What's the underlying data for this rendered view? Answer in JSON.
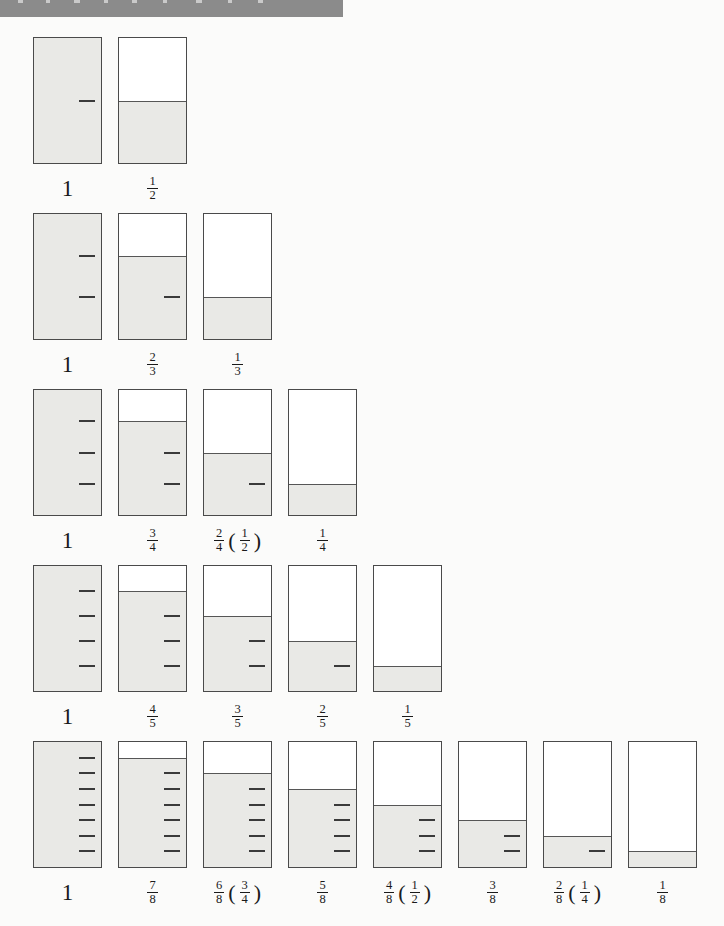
{
  "colors": {
    "title_bar": "#8b8b8b",
    "glass_fill": "#e9e9e6",
    "glass_border": "#4a4a4a",
    "fill_line": "#565656",
    "tick": "#3a3a3a",
    "label_text": "#1a1a1a"
  },
  "rows": [
    {
      "name": "halves",
      "glasses": [
        {
          "label_whole": "1",
          "filled": 2,
          "parts": 2
        },
        {
          "label_num": "1",
          "label_den": "2",
          "filled": 1,
          "parts": 2
        }
      ]
    },
    {
      "name": "thirds",
      "glasses": [
        {
          "label_whole": "1",
          "filled": 3,
          "parts": 3
        },
        {
          "label_num": "2",
          "label_den": "3",
          "filled": 2,
          "parts": 3
        },
        {
          "label_num": "1",
          "label_den": "3",
          "filled": 1,
          "parts": 3
        }
      ]
    },
    {
      "name": "quarters",
      "glasses": [
        {
          "label_whole": "1",
          "filled": 4,
          "parts": 4
        },
        {
          "label_num": "3",
          "label_den": "4",
          "filled": 3,
          "parts": 4
        },
        {
          "label_num": "2",
          "label_den": "4",
          "equiv_num": "1",
          "equiv_den": "2",
          "filled": 2,
          "parts": 4
        },
        {
          "label_num": "1",
          "label_den": "4",
          "filled": 1,
          "parts": 4
        }
      ]
    },
    {
      "name": "fifths",
      "glasses": [
        {
          "label_whole": "1",
          "filled": 5,
          "parts": 5
        },
        {
          "label_num": "4",
          "label_den": "5",
          "filled": 4,
          "parts": 5
        },
        {
          "label_num": "3",
          "label_den": "5",
          "filled": 3,
          "parts": 5
        },
        {
          "label_num": "2",
          "label_den": "5",
          "filled": 2,
          "parts": 5
        },
        {
          "label_num": "1",
          "label_den": "5",
          "filled": 1,
          "parts": 5
        }
      ]
    },
    {
      "name": "eighths",
      "glasses": [
        {
          "label_whole": "1",
          "filled": 8,
          "parts": 8
        },
        {
          "label_num": "7",
          "label_den": "8",
          "filled": 7,
          "parts": 8
        },
        {
          "label_num": "6",
          "label_den": "8",
          "equiv_num": "3",
          "equiv_den": "4",
          "filled": 6,
          "parts": 8
        },
        {
          "label_num": "5",
          "label_den": "8",
          "filled": 5,
          "parts": 8
        },
        {
          "label_num": "4",
          "label_den": "8",
          "equiv_num": "1",
          "equiv_den": "2",
          "filled": 4,
          "parts": 8
        },
        {
          "label_num": "3",
          "label_den": "8",
          "filled": 3,
          "parts": 8
        },
        {
          "label_num": "2",
          "label_den": "8",
          "equiv_num": "1",
          "equiv_den": "4",
          "filled": 2,
          "parts": 8
        },
        {
          "label_num": "1",
          "label_den": "8",
          "filled": 1,
          "parts": 8
        }
      ]
    }
  ],
  "paren_open": "(",
  "paren_close": ")"
}
